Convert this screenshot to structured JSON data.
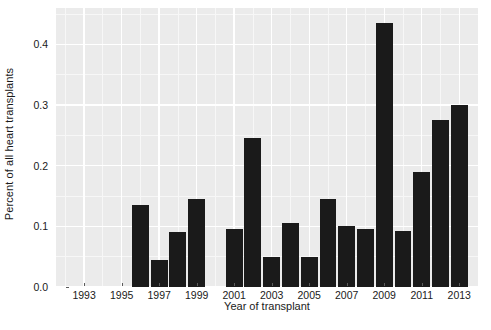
{
  "chart_data": {
    "type": "bar",
    "title": "",
    "subtitle": "",
    "xlabel": "Year of transplant",
    "ylabel": "Percent of all heart transplants",
    "categories": [
      1996,
      1997,
      1998,
      1999,
      2001,
      2002,
      2003,
      2004,
      2005,
      2006,
      2007,
      2008,
      2009,
      2010,
      2011,
      2012,
      2013
    ],
    "values": [
      0.135,
      0.045,
      0.09,
      0.145,
      0.095,
      0.245,
      0.05,
      0.105,
      0.05,
      0.145,
      0.1,
      0.095,
      0.435,
      0.093,
      0.19,
      0.275,
      0.3
    ],
    "xlim": [
      1991.5,
      2014.0
    ],
    "ylim": [
      0.0,
      0.46
    ],
    "x_tick_labels": [
      "1993",
      "1995",
      "1997",
      "1999",
      "2001",
      "2003",
      "2005",
      "2007",
      "2009",
      "2011",
      "2013"
    ],
    "x_tick_values": [
      1993,
      1995,
      1997,
      1999,
      2001,
      2003,
      2005,
      2007,
      2009,
      2011,
      2013
    ],
    "y_tick_labels": [
      "0.0",
      "0.1",
      "0.2",
      "0.3",
      "0.4"
    ],
    "y_tick_values": [
      0.0,
      0.1,
      0.2,
      0.3,
      0.4
    ],
    "y_minor_values": [
      0.05,
      0.15,
      0.25,
      0.35,
      0.45
    ],
    "x_minor_values": [
      1992,
      1994,
      1996,
      1998,
      2000,
      2002,
      2004,
      2006,
      2008,
      2010,
      2012,
      2014
    ],
    "grid": true,
    "legend": "none",
    "bar_color": "#1a1a1a",
    "panel_color": "#ebebeb",
    "gridline_color": "#ffffff",
    "background_color": "#ffffff"
  }
}
